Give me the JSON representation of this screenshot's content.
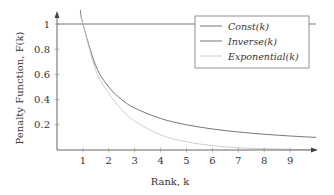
{
  "chart_data": {
    "type": "line",
    "title": "",
    "xlabel": "Rank, k",
    "ylabel": "Penalty Function, F(k)",
    "xlim": [
      0,
      10
    ],
    "ylim": [
      0,
      1.15
    ],
    "x_ticks": [
      "1",
      "2",
      "3",
      "4",
      "5",
      "6",
      "7",
      "8",
      "9"
    ],
    "y_ticks": [
      "0.2",
      "0.4",
      "0.6",
      "0.8",
      "1"
    ],
    "grid": false,
    "legend_position": "upper right",
    "series": [
      {
        "name": "Const(k)",
        "color": "#666666",
        "x": [
          0,
          10
        ],
        "y": [
          1,
          1
        ]
      },
      {
        "name": "Inverse(k)",
        "color": "#666666",
        "x": [
          0.9,
          1,
          1.5,
          2,
          2.5,
          3,
          4,
          5,
          6,
          7,
          8,
          9,
          10
        ],
        "y": [
          1.11,
          1.0,
          0.667,
          0.5,
          0.4,
          0.333,
          0.25,
          0.2,
          0.167,
          0.143,
          0.125,
          0.111,
          0.1
        ]
      },
      {
        "name": "Exponential(k)",
        "color": "#c8c8c8",
        "x": [
          0.9,
          1,
          1.5,
          2,
          2.5,
          3,
          4,
          5,
          6,
          7,
          8,
          9,
          10
        ],
        "y": [
          1.08,
          1.0,
          0.63,
          0.45,
          0.32,
          0.23,
          0.12,
          0.065,
          0.035,
          0.018,
          0.01,
          0.005,
          0.003
        ]
      }
    ]
  },
  "legend": {
    "items": [
      "Const(k)",
      "Inverse(k)",
      "Exponential(k)"
    ]
  },
  "axes": {
    "xlabel": "Rank, k",
    "ylabel": "Penalty Function, F(k)"
  }
}
